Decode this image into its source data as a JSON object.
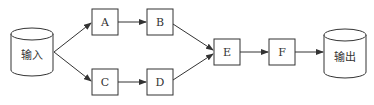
{
  "diagram": {
    "type": "dataflow",
    "nodes": {
      "input": {
        "label": "输入",
        "shape": "cylinder"
      },
      "a": {
        "label": "A",
        "shape": "box"
      },
      "b": {
        "label": "B",
        "shape": "box"
      },
      "c": {
        "label": "C",
        "shape": "box"
      },
      "d": {
        "label": "D",
        "shape": "box"
      },
      "e": {
        "label": "E",
        "shape": "box"
      },
      "f": {
        "label": "F",
        "shape": "box"
      },
      "output": {
        "label": "输出",
        "shape": "cylinder"
      }
    },
    "edges": [
      {
        "from": "输入",
        "to": "A"
      },
      {
        "from": "输入",
        "to": "C"
      },
      {
        "from": "A",
        "to": "B"
      },
      {
        "from": "C",
        "to": "D"
      },
      {
        "from": "B",
        "to": "E"
      },
      {
        "from": "D",
        "to": "E"
      },
      {
        "from": "E",
        "to": "F"
      },
      {
        "from": "F",
        "to": "输出"
      }
    ],
    "colors": {
      "stroke": "#333333",
      "background": "#ffffff"
    }
  }
}
